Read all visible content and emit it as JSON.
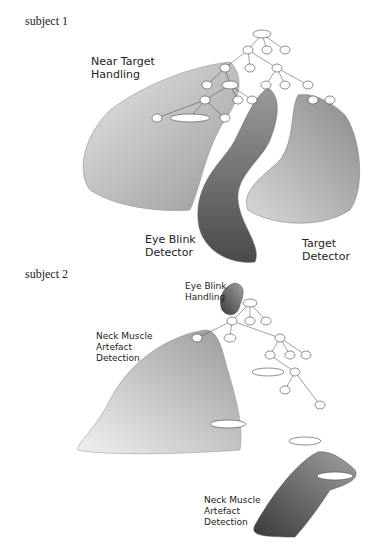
{
  "figure": {
    "panels": [
      {
        "title": "subject 1",
        "regions": [
          {
            "label": "Near Target\nHandling",
            "shade": "#bdbdbd"
          },
          {
            "label": "Eye Blink\nDetector",
            "shade": "#707070"
          },
          {
            "label": "Target\nDetector",
            "shade": "#a8a8a8"
          }
        ]
      },
      {
        "title": "subject 2",
        "regions": [
          {
            "label": "Eye Blink\nHandling",
            "shade": "#6a6a6a"
          },
          {
            "label": "Neck Muscle\nArtefact\nDetection",
            "shade": "#c4c4c4"
          },
          {
            "label": "Neck Muscle\nArtefact\nDetection",
            "shade": "#5a5a5a"
          }
        ]
      }
    ]
  }
}
